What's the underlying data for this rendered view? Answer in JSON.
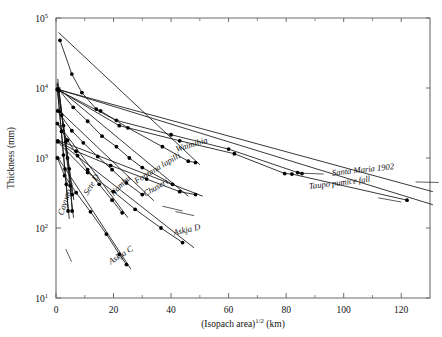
{
  "chart_data": {
    "type": "line",
    "title": "",
    "xlabel": "(Isopach area)^1/2 (km)",
    "xlabel_base": "(Isopach area)",
    "xlabel_exp": "1/2",
    "xlabel_unit": "(km)",
    "ylabel": "Thickness (mm)",
    "xlim": [
      0,
      130
    ],
    "ylim": [
      10,
      100000
    ],
    "yscale": "log",
    "xscale": "linear",
    "grid": false,
    "legend": "inline-annotations",
    "xticks": [
      0,
      20,
      40,
      60,
      80,
      100,
      120
    ],
    "xticklabels": [
      "0",
      "20",
      "40",
      "60",
      "80",
      "100",
      "120"
    ],
    "xminorticks": [
      10,
      30,
      50,
      70,
      90,
      110
    ],
    "yticks": [
      10,
      100,
      1000,
      10000,
      100000
    ],
    "yticklabels": [
      "10^1",
      "10^2",
      "10^3",
      "10^4",
      "10^5"
    ],
    "ytick_mantissa": [
      "10",
      "10",
      "10",
      "10",
      "10"
    ],
    "ytick_exponents": [
      "1",
      "2",
      "3",
      "4",
      "5"
    ],
    "series": [
      {
        "name": "Santa Maria 1902",
        "label": "Santa Maria 1902",
        "label_x": 96,
        "label_y": 560,
        "label_rotate": -6,
        "leader_from": [
          84,
          610
        ],
        "leader_to": [
          93,
          590
        ],
        "leader2_from": [
          125,
          455
        ],
        "leader2_to": [
          133,
          447
        ],
        "points": [
          [
            0.6,
            9400
          ],
          [
            21.0,
            3450
          ],
          [
            40.0,
            2150
          ],
          [
            60.0,
            1340
          ],
          [
            84.0,
            620
          ],
          [
            85.5,
            600
          ]
        ],
        "fit": [
          [
            0.3,
            9600
          ],
          [
            131,
            330
          ]
        ]
      },
      {
        "name": "Taupo pumice fall",
        "label": "Taupo pumice fall",
        "label_x": 88,
        "label_y": 360,
        "label_rotate": -7,
        "leader_from": [
          120,
          235
        ],
        "leader_to": [
          112,
          270
        ],
        "points": [
          [
            0.5,
            9500
          ],
          [
            22.0,
            2900
          ],
          [
            43.0,
            1760
          ],
          [
            62.0,
            1150
          ],
          [
            79.5,
            600
          ],
          [
            82.0,
            590
          ],
          [
            122.0,
            250
          ]
        ],
        "fit": [
          [
            0.3,
            9700
          ],
          [
            131,
            215
          ]
        ]
      },
      {
        "name": "Waimihia",
        "label": "Waimihia",
        "label_x": 42,
        "label_y": 1220,
        "label_rotate": -17,
        "points": [
          [
            1.4,
            48000
          ],
          [
            5.5,
            15800
          ],
          [
            9.0,
            8600
          ],
          [
            14.0,
            5000
          ],
          [
            15.5,
            4700
          ],
          [
            25.0,
            2700
          ],
          [
            37.0,
            1450
          ],
          [
            46.0,
            900
          ],
          [
            48.5,
            860
          ]
        ],
        "fit": [
          [
            0.9,
            62000
          ],
          [
            50,
            800
          ]
        ]
      },
      {
        "name": "Fontana lapilli",
        "label": "Fontana lapilli",
        "label_x": 28,
        "label_y": 430,
        "label_rotate": -31,
        "leader_from": [
          37,
          205
        ],
        "leader_to": [
          44,
          175
        ],
        "points": [
          [
            0.8,
            9700
          ],
          [
            6.0,
            5300
          ],
          [
            11.0,
            3350
          ],
          [
            16.0,
            2050
          ],
          [
            21.0,
            1450
          ],
          [
            25.5,
            1000
          ],
          [
            30.0,
            730
          ],
          [
            40.5,
            420
          ]
        ],
        "fit": [
          [
            0.4,
            10200
          ],
          [
            46,
            285
          ]
        ]
      },
      {
        "name": "Chuseri",
        "label": "Chuseri",
        "label_x": 31,
        "label_y": 280,
        "label_rotate": -30,
        "leader_from": [
          41.5,
          172
        ],
        "leader_to": [
          48,
          150
        ],
        "points": [
          [
            0.6,
            4700
          ],
          [
            5.5,
            2450
          ],
          [
            9.5,
            1650
          ],
          [
            14.5,
            1050
          ],
          [
            19.5,
            680
          ],
          [
            24.5,
            440
          ],
          [
            30.0,
            300
          ]
        ],
        "fit": [
          [
            0.3,
            5100
          ],
          [
            34,
            245
          ]
        ]
      },
      {
        "name": "Nambu",
        "label": "Nambu",
        "label_x": 20,
        "label_y": 285,
        "label_rotate": -45,
        "points": [
          [
            0.5,
            3100
          ],
          [
            4.0,
            1800
          ],
          [
            7.5,
            1080
          ],
          [
            11.0,
            680
          ],
          [
            15.0,
            420
          ],
          [
            19.5,
            250
          ],
          [
            23.0,
            165
          ]
        ],
        "fit": [
          [
            0.2,
            3300
          ],
          [
            25,
            140
          ]
        ]
      },
      {
        "name": "Sete D",
        "label": "Sete D",
        "label_x": 11,
        "label_y": 290,
        "label_rotate": -58,
        "points": [
          [
            0.6,
            1750
          ],
          [
            7.0,
            1250
          ],
          [
            19.0,
            780
          ],
          [
            31.5,
            500
          ],
          [
            43.0,
            330
          ],
          [
            48.5,
            300
          ]
        ],
        "fit": [
          [
            0.3,
            1820
          ],
          [
            51,
            285
          ]
        ]
      },
      {
        "name": "Askja D",
        "label": "Askja D",
        "label_x": 41,
        "label_y": 78,
        "label_rotate": -13,
        "points": [
          [
            0.6,
            1700
          ],
          [
            11.0,
            620
          ],
          [
            20.0,
            330
          ],
          [
            27.5,
            185
          ],
          [
            36.5,
            100
          ],
          [
            44.0,
            62
          ]
        ],
        "fit": [
          [
            0.3,
            1800
          ],
          [
            48,
            52
          ]
        ]
      },
      {
        "name": "Askja C",
        "label": "Askja C",
        "label_x": 19,
        "label_y": 30,
        "label_rotate": -32,
        "points": [
          [
            0.5,
            1000
          ],
          [
            3.0,
            560
          ],
          [
            7.0,
            320
          ],
          [
            12.0,
            170
          ],
          [
            17.5,
            82
          ],
          [
            22.0,
            42
          ],
          [
            24.5,
            30
          ]
        ],
        "fit": [
          [
            0.25,
            1080
          ],
          [
            26,
            26
          ]
        ]
      },
      {
        "name": "Cayuao C",
        "label": "Cayuao C",
        "label_x": 2.4,
        "label_y": 150,
        "label_rotate": -72,
        "leader_from": [
          3.4,
          50
        ],
        "leader_to": [
          5.4,
          33
        ],
        "points": [
          [
            0.5,
            9600
          ],
          [
            1.2,
            4600
          ],
          [
            1.9,
            2400
          ],
          [
            2.6,
            1100
          ],
          [
            3.1,
            700
          ],
          [
            3.6,
            420
          ],
          [
            4.2,
            175
          ]
        ],
        "fit": [
          [
            0.35,
            11500
          ],
          [
            4.6,
            135
          ]
        ]
      },
      {
        "name": "steep-unlabeled-a",
        "label": "",
        "points": [
          [
            1.0,
            9200
          ],
          [
            2.6,
            2900
          ],
          [
            4.0,
            1000
          ],
          [
            5.0,
            400
          ],
          [
            5.6,
            175
          ]
        ],
        "fit": [
          [
            0.6,
            13500
          ],
          [
            6.1,
            140
          ]
        ]
      },
      {
        "name": "steep-unlabeled-b",
        "label": "",
        "points": [
          [
            0.7,
            9500
          ],
          [
            2.0,
            4100
          ],
          [
            3.4,
            1700
          ],
          [
            4.6,
            700
          ],
          [
            5.6,
            300
          ]
        ],
        "fit": [
          [
            0.4,
            12000
          ],
          [
            6.2,
            250
          ]
        ]
      }
    ]
  },
  "colors": {
    "axis": "#6b6b6b",
    "line": "#151515",
    "point": "#000000",
    "background": "#ffffff"
  }
}
